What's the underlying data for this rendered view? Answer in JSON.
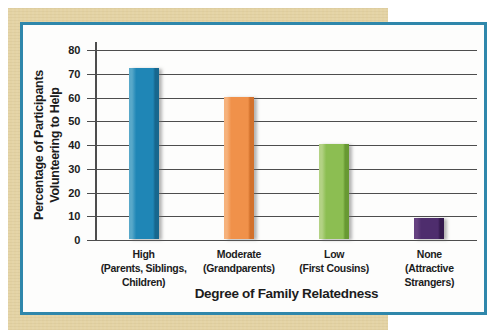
{
  "figure": {
    "page_background": "#ffffff",
    "mat_color": "#e4d3a4",
    "panel_border_color": "#2f87ab",
    "panel_background": "#fdfdfc",
    "gridline_color": "#4d4d4d",
    "text_color": "#1c1c1c"
  },
  "chart_data": {
    "type": "bar",
    "title": "",
    "xlabel": "Degree of Family Relatedness",
    "ylabel": "Percentage of Participants Volunteering to Help",
    "ylabel_lines": [
      "Percentage of Participants",
      "Volunteering to Help"
    ],
    "categories": [
      "High",
      "Moderate",
      "Low",
      "None"
    ],
    "category_sublabels": [
      "(Parents, Siblings, Children)",
      "(Grandparents)",
      "(First Cousins)",
      "(Attractive Strangers)"
    ],
    "values": [
      72,
      60,
      40,
      9
    ],
    "ylim": [
      0,
      80
    ],
    "yticks": [
      0,
      10,
      20,
      30,
      40,
      50,
      60,
      70,
      80
    ],
    "grid": "horizontal",
    "legend": "none",
    "bar_colors": [
      {
        "name": "blue",
        "light": "#58a8c9",
        "main": "#1f86b6",
        "dark": "#17678e"
      },
      {
        "name": "orange",
        "light": "#f6b27c",
        "main": "#f0914a",
        "dark": "#d2712c"
      },
      {
        "name": "green",
        "light": "#b3d284",
        "main": "#8cbe52",
        "dark": "#689933"
      },
      {
        "name": "purple",
        "light": "#654180",
        "main": "#4e2d6d",
        "dark": "#34194d"
      }
    ]
  }
}
